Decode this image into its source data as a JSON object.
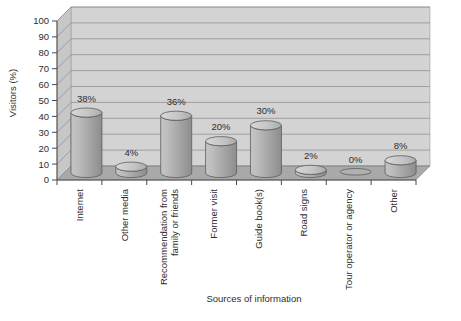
{
  "chart_data": {
    "type": "bar",
    "title": "",
    "subtitle": "",
    "xlabel": "Sources of information",
    "ylabel": "Visitors (%)",
    "ylim": [
      0,
      100
    ],
    "ytick_step": 10,
    "yticks": [
      "100",
      "90",
      "80",
      "70",
      "60",
      "50",
      "40",
      "30",
      "20",
      "10",
      "0"
    ],
    "grid": true,
    "legend": "none",
    "style": "3d-cylinder",
    "categories": [
      "Internet",
      "Other media",
      "Recommendation from\nfamily or friends",
      "Former visit",
      "Guide book(s)",
      "Road signs",
      "Tour operator or agency",
      "Other"
    ],
    "values": [
      38,
      4,
      36,
      20,
      30,
      2,
      0,
      8
    ],
    "data_labels": [
      "38%",
      "4%",
      "36%",
      "20%",
      "30%",
      "2%",
      "0%",
      "8%"
    ],
    "colors": {
      "bar_light": "#b9b9b9",
      "bar_mid": "#a6a6a6",
      "bar_dark": "#8e8e8e",
      "bar_top": "#cdcdcd",
      "bar_outline": "#5d5d5d",
      "wall_back": "#d3d3d3",
      "wall_side": "#c2c2c2",
      "floor": "#a9a9a9",
      "gridline": "#8a8a8a",
      "axis": "#4a4a4a",
      "page_bg": "#ffffff",
      "text": "#2d2d2d"
    }
  },
  "category_labels_flat": [
    "Internet",
    "Other media",
    "Recommendation from",
    "family or friends",
    "Former visit",
    "Guide book(s)",
    "Road signs",
    "Tour operator or agency",
    "Other"
  ]
}
